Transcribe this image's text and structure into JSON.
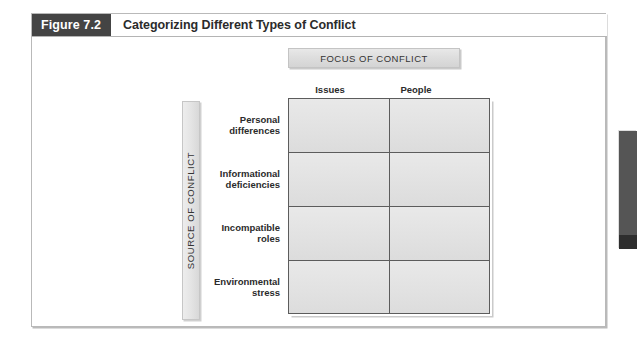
{
  "figure": {
    "label": "Figure 7.2",
    "title": "Categorizing Different Types of Conflict"
  },
  "matrix": {
    "column_axis_label": "FOCUS OF CONFLICT",
    "row_axis_label": "SOURCE OF CONFLICT",
    "columns": [
      {
        "label": "Issues"
      },
      {
        "label": "People"
      }
    ],
    "rows": [
      {
        "line1": "Personal",
        "line2": "differences",
        "cells": [
          "",
          ""
        ]
      },
      {
        "line1": "Informational",
        "line2": "deficiencies",
        "cells": [
          "",
          ""
        ]
      },
      {
        "line1": "Incompatible",
        "line2": "roles",
        "cells": [
          "",
          ""
        ]
      },
      {
        "line1": "Environmental",
        "line2": "stress",
        "cells": [
          "",
          ""
        ]
      }
    ]
  },
  "colors": {
    "figure_label_bg": "#444444",
    "cell_fill": "#e4e4e4",
    "grid_line": "#5c5c5c",
    "banner_fill": "#dedede",
    "page_tab": "#555555"
  },
  "page_tab": {
    "name": "chapter-edge-tab"
  }
}
